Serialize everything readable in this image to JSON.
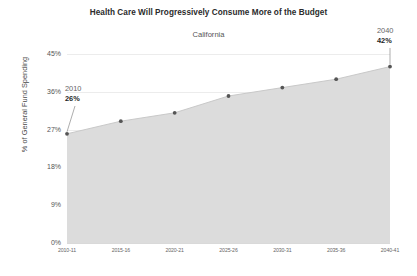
{
  "chart_data": {
    "type": "area",
    "title": "Health Care Will Progressively Consume More of the Budget",
    "subtitle": "California",
    "xlabel": "",
    "ylabel": "% of General Fund Spending",
    "categories": [
      "2010-11",
      "2015-16",
      "2020-21",
      "2025-26",
      "2030-31",
      "2035-36",
      "2040-41"
    ],
    "values": [
      26,
      29,
      31,
      35,
      37,
      39,
      42
    ],
    "ylim": [
      0,
      45
    ],
    "y_ticks": [
      "0%",
      "9%",
      "18%",
      "27%",
      "36%",
      "45%"
    ],
    "y_tick_values": [
      0,
      9,
      18,
      27,
      36,
      45
    ],
    "grid": true,
    "legend": "none",
    "series_name": "Health Care Share of General Fund Spending",
    "annotations": [
      {
        "year": "2010",
        "value": "26%",
        "position": "left"
      },
      {
        "year": "2040",
        "value": "42%",
        "position": "right"
      }
    ],
    "colors": {
      "area_fill": "#dcdcdc",
      "line": "#c9c9c9",
      "marker": "#555555",
      "gridline": "#ececec",
      "title": "#2b2b2b",
      "background": "#ffffff"
    }
  }
}
